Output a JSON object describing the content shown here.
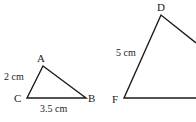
{
  "triangle1": {
    "vertices": {
      "A": "A",
      "B": "B",
      "C": "C"
    },
    "side_CA": "2 cm",
    "side_CB": "3.5 cm"
  },
  "triangle2": {
    "vertices": {
      "D": "D",
      "F": "F"
    },
    "side_FD": "5 cm"
  },
  "colors": {
    "stroke": "#1a1a1a",
    "text": "#222222",
    "background": "#ffffff"
  }
}
